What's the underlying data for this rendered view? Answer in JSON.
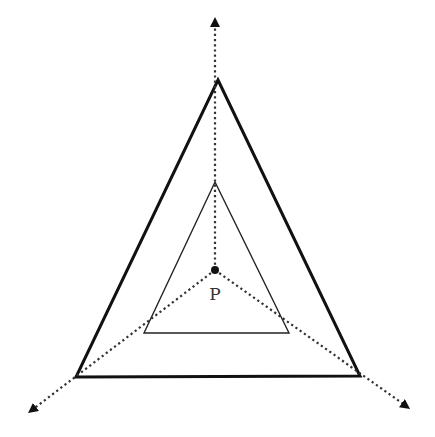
{
  "diagram": {
    "center_point": {
      "label": "P",
      "x": 215,
      "y": 270
    },
    "outer_triangle": {
      "stroke_width": 3,
      "vertices": [
        [
          218,
          80
        ],
        [
          360,
          376
        ],
        [
          76,
          377
        ]
      ]
    },
    "inner_triangle": {
      "stroke_width": 1.4,
      "vertices": [
        [
          215,
          182
        ],
        [
          289,
          333
        ],
        [
          144,
          333
        ]
      ]
    },
    "rays": [
      {
        "name": "up",
        "to": [
          215,
          22
        ]
      },
      {
        "name": "down-left",
        "to": [
          32,
          410
        ]
      },
      {
        "name": "down-right",
        "to": [
          406,
          406
        ]
      }
    ],
    "colors": {
      "stroke": "#111111",
      "dotted": "#333333",
      "background": "#ffffff"
    }
  }
}
